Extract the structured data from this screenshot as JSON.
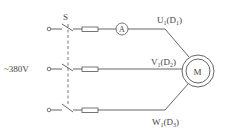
{
  "diagram": {
    "type": "three-phase motor connection circuit",
    "switch_label": "S",
    "supply_label": "~380V",
    "ammeter_label": "A",
    "motor_label": "M",
    "terminals": [
      {
        "main": "U",
        "main_sub": "1",
        "open": "(D",
        "paren_sub": "1",
        "close": ")"
      },
      {
        "main": "V",
        "main_sub": "1",
        "open": "(D",
        "paren_sub": "2",
        "close": ")"
      },
      {
        "main": "W",
        "main_sub": "1",
        "open": "(D",
        "paren_sub": "3",
        "close": ")"
      }
    ],
    "line_color": "#555555"
  }
}
